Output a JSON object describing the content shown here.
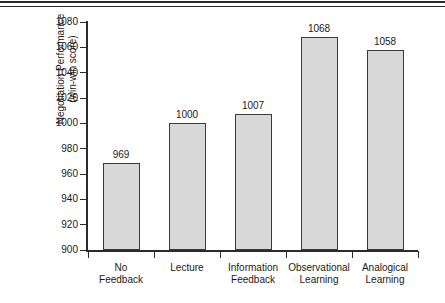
{
  "figure": {
    "background_color": "#ffffff",
    "rule_color": "#2b2b2b",
    "axis_color": "#2b2b2b",
    "bar_fill_color": "#d8d8d8",
    "bar_edge_color": "#3a3a3a",
    "text_color": "#1a1a1a"
  },
  "chart_data": {
    "type": "bar",
    "title": "",
    "xlabel": "",
    "ylabel": "Negotiation Performance (win-win score)",
    "ylabel_line1": "Negotiation Performance",
    "ylabel_line2": "(win-win score)",
    "categories": [
      "No Feedback",
      "Lecture",
      "Information Feedback",
      "Observational Learning",
      "Analogical Learning"
    ],
    "category_lines": [
      [
        "No",
        "Feedback"
      ],
      [
        "Lecture",
        ""
      ],
      [
        "Information",
        "Feedback"
      ],
      [
        "Observational",
        "Learning"
      ],
      [
        "Analogical",
        "Learning"
      ]
    ],
    "values": [
      969,
      1000,
      1007,
      1068,
      1058
    ],
    "value_labels": [
      "969",
      "1000",
      "1007",
      "1068",
      "1058"
    ],
    "ylim": [
      900,
      1080
    ],
    "ytick_step": 20,
    "yticks": [
      900,
      920,
      940,
      960,
      980,
      1000,
      1020,
      1040,
      1060,
      1080
    ],
    "ytick_labels": [
      "900",
      "920",
      "940",
      "960",
      "980",
      "1000",
      "1020",
      "1040",
      "1060",
      "1080"
    ],
    "grid": false,
    "legend": false,
    "legend_position": "none"
  }
}
